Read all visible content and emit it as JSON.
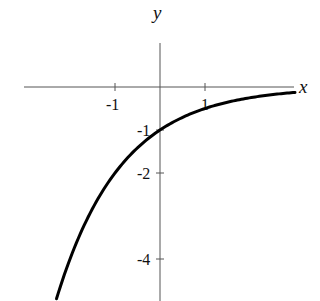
{
  "chart_data": {
    "type": "line",
    "title": "",
    "xlabel": "x",
    "ylabel": "y",
    "function": "y = -2^(-x)",
    "x_ticks": [
      {
        "value": -1,
        "label": "-1"
      },
      {
        "value": 1,
        "label": "1"
      }
    ],
    "y_ticks": [
      {
        "value": -1,
        "label": "-1"
      },
      {
        "value": -2,
        "label": "-2"
      },
      {
        "value": -4,
        "label": "-4"
      }
    ],
    "xlim": [
      -3,
      3.1
    ],
    "ylim": [
      -5,
      1
    ],
    "grid": false,
    "legend": null,
    "series": [
      {
        "name": "curve",
        "x": [
          -2.3,
          -2.0,
          -1.5,
          -1.0,
          -0.5,
          0,
          0.5,
          1.0,
          1.5,
          2.0,
          2.5,
          3.0
        ],
        "y": [
          -4.92,
          -4.0,
          -2.83,
          -2.0,
          -1.41,
          -1.0,
          -0.71,
          -0.5,
          -0.35,
          -0.25,
          -0.18,
          -0.13
        ]
      }
    ]
  },
  "axes": {
    "x_name": "x",
    "y_name": "y"
  }
}
